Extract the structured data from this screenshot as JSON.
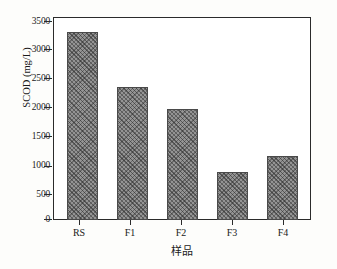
{
  "chart_data": {
    "type": "bar",
    "title": "",
    "subtitle": "",
    "categories": [
      "RS",
      "F1",
      "F2",
      "F3",
      "F4"
    ],
    "values": [
      3430,
      2420,
      2020,
      870,
      1170
    ],
    "series": [
      {
        "name": "SCOD",
        "values": [
          3430,
          2420,
          2020,
          870,
          1170
        ]
      }
    ],
    "xlabel": "样品",
    "ylabel": "SCOD (mg/L)",
    "ylim": [
      0,
      3700
    ],
    "yticks": [
      0,
      500,
      1000,
      1500,
      2000,
      2500,
      3000,
      3500
    ],
    "ytick_labels": [
      "0",
      "500",
      "1000",
      "1500",
      "2000",
      "2500",
      "3000",
      "3500"
    ],
    "xticks": [
      "RS",
      "F1",
      "F2",
      "F3",
      "F4"
    ],
    "grid": false,
    "legend": false,
    "legend_position": "none",
    "bar_fill": "#949494",
    "bar_hatch": "cross-hatch",
    "bar_edge_color": "#4a4a4a",
    "axis_color": "#2b2b2b",
    "background": "#ffffff",
    "annotations": []
  },
  "axes": {
    "y_title": "SCOD (mg/L)",
    "x_title": "样品"
  }
}
